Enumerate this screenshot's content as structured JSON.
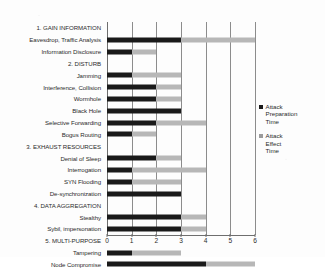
{
  "chart_data": {
    "type": "bar",
    "orientation": "horizontal",
    "stacked": true,
    "title": "",
    "xlabel": "",
    "ylabel": "",
    "xlim": [
      0,
      6
    ],
    "xticks": [
      0,
      1,
      2,
      3,
      4,
      5,
      6
    ],
    "xtick_labels": [
      "0",
      "1",
      "2",
      "3",
      "4",
      "5",
      "6"
    ],
    "grid": true,
    "grid_axis": "x",
    "legend_position": "right",
    "categories": [
      "1. GAIN INFORMATION",
      "Eavesdrop, Traffic Analysis",
      "Information Disclosure",
      "2. DISTURB",
      "Jamming",
      "Interference, Collision",
      "Wormhole",
      "Black Hole",
      "Selective Forwarding",
      "Bogus Routing",
      "3. EXHAUST RESOURCES",
      "Denial of Sleep",
      "Interrogation",
      "SYN Flooding",
      "De-synchronization",
      "4. DATA AGGREGATION",
      "Stealthy",
      "Sybil, impersonation",
      "5. MULTI-PURPOSE",
      "Tampering",
      "Node Compromise"
    ],
    "category_is_group_header": [
      true,
      false,
      false,
      true,
      false,
      false,
      false,
      false,
      false,
      false,
      true,
      false,
      false,
      false,
      false,
      true,
      false,
      false,
      true,
      false,
      false
    ],
    "series": [
      {
        "name": "Attack Preparation Time",
        "color": "#1a1a1a",
        "values": [
          null,
          3,
          1,
          null,
          1,
          2,
          2,
          3,
          2,
          1,
          null,
          2,
          1,
          1,
          3,
          null,
          3,
          3,
          null,
          1,
          4
        ]
      },
      {
        "name": "Attack Effect Time",
        "color": "#b7b7b7",
        "values": [
          null,
          3,
          1,
          null,
          2,
          1,
          1,
          0,
          2,
          1,
          null,
          1,
          3,
          2,
          0,
          null,
          1,
          1,
          null,
          2,
          2
        ]
      }
    ],
    "bar_totals": [
      null,
      6,
      2,
      null,
      3,
      3,
      3,
      3,
      4,
      2,
      null,
      3,
      4,
      3,
      3,
      null,
      4,
      4,
      null,
      3,
      6
    ]
  },
  "legend": {
    "entries": [
      {
        "label": "Attack\nPreparation\nTime",
        "lines": [
          "Attack",
          "Preparation",
          "Time"
        ],
        "color": "#1a1a1a",
        "swatch": "square-marker-icon"
      },
      {
        "label": "Attack\nEffect\nTime",
        "lines": [
          "Attack",
          "Effect",
          "Time"
        ],
        "color": "#9b9b9b",
        "swatch": "square-marker-icon"
      }
    ]
  },
  "axis": {
    "x_tick_labels": [
      "0",
      "1",
      "2",
      "3",
      "4",
      "5",
      "6"
    ]
  }
}
